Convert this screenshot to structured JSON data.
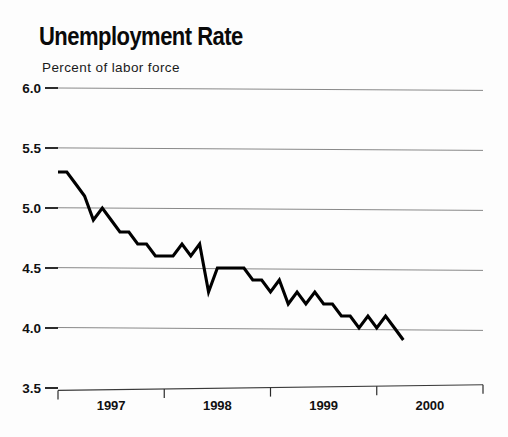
{
  "chart_data": {
    "type": "line",
    "title": "Unemployment Rate",
    "subtitle": "Percent of labor force",
    "xlabel": "",
    "ylabel": "Percent of labor force",
    "ylim": [
      3.5,
      6.0
    ],
    "xlim": [
      1997.0,
      2001.0
    ],
    "grid": true,
    "legend": null,
    "yticks": [
      "6.0",
      "5.5",
      "5.0",
      "4.5",
      "4.0",
      "3.5"
    ],
    "ytick_values": [
      6.0,
      5.5,
      5.0,
      4.5,
      4.0,
      3.5
    ],
    "xticks": [
      "1997",
      "1998",
      "1999",
      "2000"
    ],
    "xtick_values": [
      1997,
      1998,
      1999,
      2000
    ],
    "x_boundaries": [
      1997,
      1998,
      1999,
      2000,
      2001
    ],
    "series": [
      {
        "name": "Unemployment Rate",
        "color": "#000000",
        "x": [
          1997.0,
          1997.083,
          1997.167,
          1997.25,
          1997.333,
          1997.417,
          1997.5,
          1997.583,
          1997.667,
          1997.75,
          1997.833,
          1997.917,
          1998.0,
          1998.083,
          1998.167,
          1998.25,
          1998.333,
          1998.417,
          1998.5,
          1998.583,
          1998.667,
          1998.75,
          1998.833,
          1998.917,
          1999.0,
          1999.083,
          1999.167,
          1999.25,
          1999.333,
          1999.417,
          1999.5,
          1999.583,
          1999.667,
          1999.75,
          1999.833,
          1999.917,
          2000.0,
          2000.083,
          2000.167,
          2000.25
        ],
        "x_labels": [
          "Jan 1997",
          "Feb 1997",
          "Mar 1997",
          "Apr 1997",
          "May 1997",
          "Jun 1997",
          "Jul 1997",
          "Aug 1997",
          "Sep 1997",
          "Oct 1997",
          "Nov 1997",
          "Dec 1997",
          "Jan 1998",
          "Feb 1998",
          "Mar 1998",
          "Apr 1998",
          "May 1998",
          "Jun 1998",
          "Jul 1998",
          "Aug 1998",
          "Sep 1998",
          "Oct 1998",
          "Nov 1998",
          "Dec 1998",
          "Jan 1999",
          "Feb 1999",
          "Mar 1999",
          "Apr 1999",
          "May 1999",
          "Jun 1999",
          "Jul 1999",
          "Aug 1999",
          "Sep 1999",
          "Oct 1999",
          "Nov 1999",
          "Dec 1999",
          "Jan 2000",
          "Feb 2000",
          "Mar 2000",
          "Apr 2000"
        ],
        "values": [
          5.3,
          5.3,
          5.2,
          5.1,
          4.9,
          5.0,
          4.9,
          4.8,
          4.8,
          4.7,
          4.7,
          4.6,
          4.6,
          4.6,
          4.7,
          4.6,
          4.7,
          4.3,
          4.5,
          4.5,
          4.5,
          4.5,
          4.4,
          4.4,
          4.3,
          4.4,
          4.2,
          4.3,
          4.2,
          4.3,
          4.2,
          4.2,
          4.1,
          4.1,
          4.0,
          4.1,
          4.0,
          4.1,
          4.0,
          3.9
        ]
      }
    ]
  },
  "geometry": {
    "plot_left": 58,
    "plot_right": 483,
    "plot_top": 88,
    "plot_bottom": 388,
    "px_per_year": 106.25
  }
}
